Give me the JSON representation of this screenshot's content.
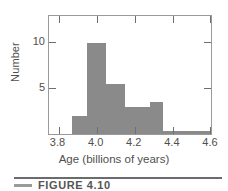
{
  "figure": {
    "caption_label": "FIGURE  4.10",
    "caption_swatch_name": "caption-rule-swatch"
  },
  "chart_data": {
    "type": "bar",
    "title": "",
    "subtitle": "",
    "xlabel": "Age (billions of years)",
    "ylabel": "Number",
    "xlim": [
      3.75,
      4.6
    ],
    "ylim": [
      0,
      13
    ],
    "grid": false,
    "legend": null,
    "bin_width": 0.1,
    "xticks": [
      "3.8",
      "4.0",
      "4.2",
      "4.4",
      "4.6"
    ],
    "xtick_values": [
      3.8,
      4.0,
      4.2,
      4.4,
      4.6
    ],
    "yticks": [
      "5",
      "10"
    ],
    "ytick_values": [
      5,
      10
    ],
    "bar_color": "#8a8a8a",
    "frame_color": "#9a9a9a",
    "text_color": "#4f4f4f",
    "bins": [
      {
        "x0": 3.75,
        "x1": 3.87,
        "value": 0
      },
      {
        "x0": 3.87,
        "x1": 3.95,
        "value": 2
      },
      {
        "x0": 3.95,
        "x1": 4.05,
        "value": 10
      },
      {
        "x0": 4.05,
        "x1": 4.15,
        "value": 5.5
      },
      {
        "x0": 4.15,
        "x1": 4.28,
        "value": 3
      },
      {
        "x0": 4.28,
        "x1": 4.35,
        "value": 3.5
      },
      {
        "x0": 4.35,
        "x1": 4.6,
        "value": 0.35
      }
    ],
    "categories": [
      "3.87-3.95",
      "3.95-4.05",
      "4.05-4.15",
      "4.15-4.28",
      "4.28-4.35",
      "4.35-4.60"
    ],
    "values": [
      2,
      10,
      5.5,
      3,
      3.5,
      0.35
    ]
  }
}
